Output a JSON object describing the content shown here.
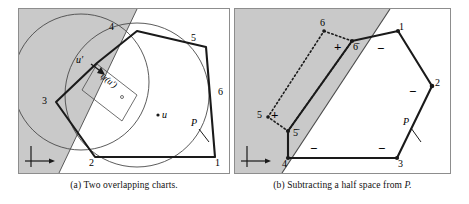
{
  "figure": {
    "width": 469,
    "height": 204,
    "background": "#ffffff",
    "shade_color": "#c9c9c9",
    "line_color": "#1a1a1a",
    "thin_line_color": "#4a4a4a",
    "frame_color": "#8d8d8d"
  },
  "panel_a": {
    "caption_prefix": "(a)",
    "caption_text": "Two overlapping charts.",
    "vertex_labels": [
      {
        "id": "v1",
        "text": "1",
        "x": 196,
        "y": 157
      },
      {
        "id": "v2",
        "text": "2",
        "x": 76,
        "y": 157
      },
      {
        "id": "v3",
        "text": "3",
        "x": 22,
        "y": 95
      },
      {
        "id": "v4",
        "text": "4",
        "x": 95,
        "y": 28
      },
      {
        "id": "v5",
        "text": "5",
        "x": 174,
        "y": 33
      },
      {
        "id": "v6",
        "text": "6",
        "x": 205,
        "y": 84
      }
    ],
    "point_labels": [
      {
        "id": "u-prime",
        "text": "u′",
        "x": 62,
        "y": 59
      },
      {
        "id": "u",
        "text": "u",
        "x": 144,
        "y": 109
      },
      {
        "id": "psi-u-prime",
        "text": "ψ(u′)",
        "x": 102,
        "y": 72
      },
      {
        "id": "polygon-p",
        "text": "P",
        "x": 177,
        "y": 116
      }
    ],
    "axes_icon": "coordinate-axes"
  },
  "panel_b": {
    "caption_prefix": "(b)",
    "caption_text": "Subtracting a half space from",
    "caption_italic_tail": "P.",
    "vertex_labels": [
      {
        "id": "v1",
        "text": "1",
        "x": 168,
        "y": 30
      },
      {
        "id": "v2",
        "text": "2",
        "x": 204,
        "y": 82
      },
      {
        "id": "v3",
        "text": "3",
        "x": 167,
        "y": 158
      },
      {
        "id": "v4",
        "text": "4",
        "x": 57,
        "y": 158
      },
      {
        "id": "v5bar",
        "text": "5̄",
        "x": 57,
        "y": 128
      },
      {
        "id": "v6bar",
        "text": "6̄",
        "x": 118,
        "y": 40
      },
      {
        "id": "v5",
        "text": "5",
        "x": 19,
        "y": 99
      },
      {
        "id": "v6",
        "text": "6",
        "x": 91,
        "y": 16
      }
    ],
    "sign_labels": [
      {
        "id": "plus-upper",
        "text": "+",
        "x": 103,
        "y": 34
      },
      {
        "id": "plus-lower",
        "text": "+",
        "x": 38,
        "y": 101
      },
      {
        "id": "minus-top",
        "text": "−",
        "x": 145,
        "y": 40
      },
      {
        "id": "minus-right",
        "text": "−",
        "x": 177,
        "y": 83
      },
      {
        "id": "minus-bottom-right",
        "text": "−",
        "x": 146,
        "y": 141
      },
      {
        "id": "minus-bottom-left",
        "text": "−",
        "x": 78,
        "y": 141
      }
    ],
    "point_labels": [
      {
        "id": "polygon-p",
        "text": "P",
        "x": 172,
        "y": 115
      }
    ],
    "axes_icon": "coordinate-axes"
  }
}
